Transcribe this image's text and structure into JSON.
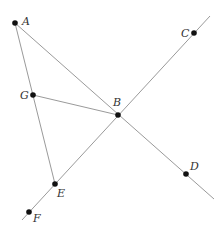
{
  "diagram": {
    "type": "geometry",
    "points": [
      {
        "id": "A",
        "label": "A",
        "x": 15,
        "y": 23,
        "lx": 22,
        "ly": 25
      },
      {
        "id": "B",
        "label": "B",
        "x": 118,
        "y": 115,
        "lx": 113,
        "ly": 106
      },
      {
        "id": "C",
        "label": "C",
        "x": 194,
        "y": 33,
        "lx": 181,
        "ly": 37
      },
      {
        "id": "D",
        "label": "D",
        "x": 186,
        "y": 174,
        "lx": 190,
        "ly": 170
      },
      {
        "id": "E",
        "label": "E",
        "x": 55,
        "y": 184,
        "lx": 57,
        "ly": 197
      },
      {
        "id": "F",
        "label": "F",
        "x": 29,
        "y": 212,
        "lx": 33,
        "ly": 222
      },
      {
        "id": "G",
        "label": "G",
        "x": 33,
        "y": 95,
        "lx": 20,
        "ly": 99
      }
    ],
    "segments": [
      {
        "id": "AD",
        "from": [
          15,
          23
        ],
        "to": [
          214,
          199
        ]
      },
      {
        "id": "AE",
        "from": [
          15,
          23
        ],
        "to": [
          55,
          184
        ]
      },
      {
        "id": "GB",
        "from": [
          33,
          95
        ],
        "to": [
          118,
          115
        ]
      },
      {
        "id": "FC",
        "from": [
          22,
          220
        ],
        "to": [
          210,
          16
        ]
      }
    ],
    "colors": {
      "line": "#9a9a9a",
      "point": "#111111",
      "label": "#333333"
    }
  }
}
